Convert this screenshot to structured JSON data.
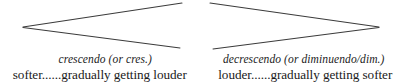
{
  "figure": {
    "stroke_color": "#3b3b3b",
    "text_color": "#1a1a1a",
    "background_color": "#ffffff",
    "symbols": [
      {
        "name": "crescendo-hairpin",
        "description": "angle opening to the right",
        "apex_x": 23,
        "apex_y": 27,
        "open_top_x": 182,
        "open_top_y": 3,
        "open_bottom_x": 180,
        "open_bottom_y": 48
      },
      {
        "name": "decrescendo-hairpin",
        "description": "angle opening to the left",
        "apex_x": 379,
        "apex_y": 27,
        "open_top_x": 210,
        "open_top_y": 3,
        "open_bottom_x": 213,
        "open_bottom_y": 49
      }
    ]
  },
  "columns": {
    "left": {
      "term": "crescendo (or cres.)",
      "description": "softer......gradually getting louder"
    },
    "right": {
      "term": "decrescendo (or diminuendo/dim.)",
      "description": "louder......gradually getting softer"
    }
  }
}
